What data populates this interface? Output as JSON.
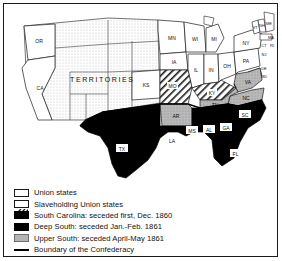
{
  "map": {
    "title": "Secession of the Southern States, 1860-1861",
    "territories_label": "TERRITORIES",
    "colors": {
      "union": "#ffffff",
      "slaveholding_union": "#ffffff",
      "deep_south": "#000000",
      "south_carolina": "#000000",
      "upper_south": "#b4b4b4",
      "territory": "#ffffff",
      "border": "#1a1a1a",
      "confederacy_boundary": "#000000",
      "frame": "#1a1a1a"
    },
    "states": [
      {
        "abbr": "OR",
        "category": "union",
        "label_style": "plain"
      },
      {
        "abbr": "CA",
        "category": "union",
        "label_style": "plain"
      },
      {
        "abbr": "KS",
        "category": "union",
        "label_style": "plain"
      },
      {
        "abbr": "MN",
        "category": "union",
        "label_style": "plain"
      },
      {
        "abbr": "WI",
        "category": "union",
        "label_style": "plain"
      },
      {
        "abbr": "IA",
        "category": "union",
        "label_style": "plain"
      },
      {
        "abbr": "MI",
        "category": "union",
        "label_style": "plain"
      },
      {
        "abbr": "IL",
        "category": "union",
        "label_style": "plain"
      },
      {
        "abbr": "IN",
        "category": "union",
        "label_style": "plain"
      },
      {
        "abbr": "OH",
        "category": "union",
        "label_style": "plain"
      },
      {
        "abbr": "PA",
        "category": "union",
        "label_style": "plain"
      },
      {
        "abbr": "NY",
        "category": "union",
        "label_style": "plain"
      },
      {
        "abbr": "VT",
        "category": "union",
        "label_style": "plain"
      },
      {
        "abbr": "NH",
        "category": "union",
        "label_style": "plain"
      },
      {
        "abbr": "ME",
        "category": "union",
        "label_style": "plain"
      },
      {
        "abbr": "MA",
        "category": "union",
        "label_style": "plain"
      },
      {
        "abbr": "CT",
        "category": "union",
        "label_style": "plain"
      },
      {
        "abbr": "RI",
        "category": "union",
        "label_style": "plain"
      },
      {
        "abbr": "NJ",
        "category": "union",
        "label_style": "plain"
      },
      {
        "abbr": "MO",
        "category": "slaveholding_union",
        "label_style": "plain"
      },
      {
        "abbr": "KY",
        "category": "slaveholding_union",
        "label_style": "plain"
      },
      {
        "abbr": "DE",
        "category": "slaveholding_union",
        "label_style": "plain"
      },
      {
        "abbr": "MD",
        "category": "slaveholding_union",
        "label_style": "plain"
      },
      {
        "abbr": "TX",
        "category": "deep_south",
        "label_style": "boxed"
      },
      {
        "abbr": "LA",
        "category": "deep_south",
        "label_style": "boxed"
      },
      {
        "abbr": "MS",
        "category": "deep_south",
        "label_style": "boxed"
      },
      {
        "abbr": "AL",
        "category": "deep_south",
        "label_style": "boxed"
      },
      {
        "abbr": "GA",
        "category": "deep_south",
        "label_style": "boxed"
      },
      {
        "abbr": "FL",
        "category": "deep_south",
        "label_style": "boxed"
      },
      {
        "abbr": "SC",
        "category": "south_carolina",
        "label_style": "boxed"
      },
      {
        "abbr": "AR",
        "category": "upper_south",
        "label_style": "plain"
      },
      {
        "abbr": "TN",
        "category": "upper_south",
        "label_style": "plain"
      },
      {
        "abbr": "VA",
        "category": "upper_south",
        "label_style": "plain"
      },
      {
        "abbr": "NC",
        "category": "upper_south",
        "label_style": "plain"
      }
    ]
  },
  "legend": {
    "items": [
      {
        "swatch": "union",
        "label": "Union states"
      },
      {
        "swatch": "hatch",
        "label": "Slaveholding Union states"
      },
      {
        "swatch": "black",
        "label": "South Carolina:  seceded first, Dec. 1860"
      },
      {
        "swatch": "black",
        "label": "Deep South:  seceded Jan.-Feb. 1861"
      },
      {
        "swatch": "gray",
        "label": "Upper South:  seceded April-May 1861"
      },
      {
        "swatch": "line",
        "label": "Boundary of the Confederacy"
      }
    ]
  }
}
